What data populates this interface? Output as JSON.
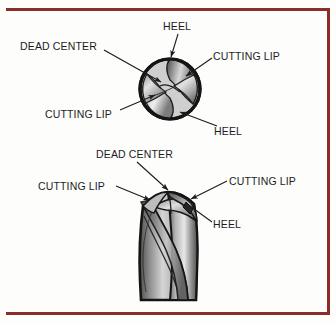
{
  "figure": {
    "background_color": "#fdfdfc",
    "border_color": "#8b2e2a",
    "ink_color": "#1c1c1c"
  },
  "top_view": {
    "caption": "End view of drill point",
    "labels": {
      "heel_top": "HEEL",
      "dead_center": "DEAD CENTER",
      "cutting_lip_right": "CUTTING LIP",
      "cutting_lip_left": "CUTTING LIP",
      "heel_bottom": "HEEL"
    }
  },
  "side_view": {
    "caption": "Isometric view of twist drill point",
    "labels": {
      "dead_center": "DEAD CENTER",
      "cutting_lip_left": "CUTTING LIP",
      "cutting_lip_right": "CUTTING LIP",
      "heel": "HEEL"
    }
  }
}
